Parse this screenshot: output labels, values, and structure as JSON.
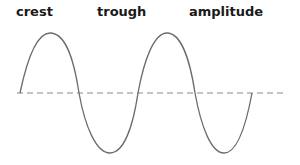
{
  "labels": {
    "crest": "crest",
    "trough": "trough",
    "amplitude": "amplitude"
  },
  "colors": {
    "wave": "#6b6b6b",
    "baseline": "#8a8a8a",
    "text": "#1a1a1a"
  }
}
